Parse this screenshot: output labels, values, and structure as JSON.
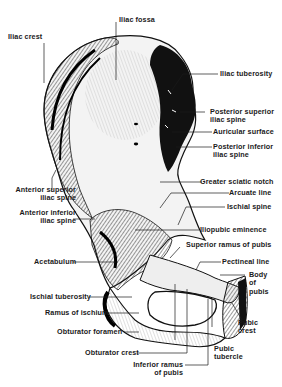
{
  "figure": {
    "colors": {
      "ink": "#1a1a1a",
      "background": "#ffffff",
      "bone_light": "#f2f2f2",
      "bone_shade": "#0d0d0d"
    }
  },
  "labels": {
    "iliac_crest": "Iliac crest",
    "iliac_fossa": "Iliac fossa",
    "iliac_tuberosity": "Iliac tuberosity",
    "posterior_superior_iliac_spine": [
      "Posterior superior",
      "iliac spine"
    ],
    "auricular_surface": "Auricular surface",
    "posterior_inferior_iliac_spine": [
      "Posterior inferior",
      "iliac spine"
    ],
    "greater_sciatic_notch": "Greater sciatic notch",
    "arcuate_line": "Arcuate line",
    "ischial_spine": "Ischial spine",
    "anterior_superior_iliac_spine": [
      "Anterior superior",
      "iliac spine"
    ],
    "anterior_inferior_iliac_spine": [
      "Anterior inferior",
      "iliac spine"
    ],
    "iliopubic_eminence": "Iliopubic eminence",
    "superior_ramus_of_pubis": "Superior ramus of pubis",
    "acetabulum": "Acetabulum",
    "pectineal_line": "Pectineal line",
    "body_of_pubis": [
      "Body",
      "of",
      "pubis"
    ],
    "ischial_tuberosity": "Ischial tuberosity",
    "ramus_of_ischium": "Ramus of ischium",
    "obturator_foramen": "Obturator foramen",
    "pubic_crest": [
      "Pubic",
      "crest"
    ],
    "obturator_crest": "Obturator crest",
    "pubic_tubercle": [
      "Pubic",
      "tubercle"
    ],
    "inferior_ramus_of_pubis": [
      "Inferior ramus",
      "of pubis"
    ]
  }
}
